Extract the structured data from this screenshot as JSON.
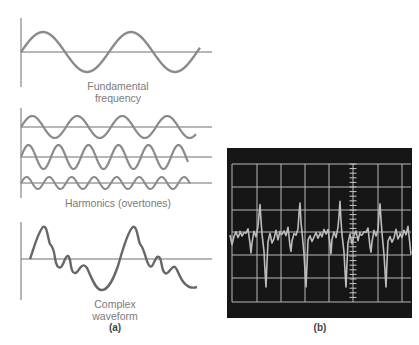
{
  "panel_a": {
    "fundamental": {
      "label_line1": "Fundamental",
      "label_line2": "frequency",
      "period_px": 88,
      "amplitude_px": 20
    },
    "harmonics": {
      "label": "Harmonics (overtones)",
      "waves": [
        {
          "name": "2nd harmonic",
          "period_px": 45,
          "amplitude_px": 11
        },
        {
          "name": "3rd harmonic",
          "period_px": 30,
          "amplitude_px": 12
        },
        {
          "name": "4th harmonic",
          "period_px": 22.5,
          "amplitude_px": 6
        }
      ]
    },
    "complex": {
      "label_line1": "Complex",
      "label_line2": "waveform"
    },
    "caption": "(a)"
  },
  "panel_b": {
    "caption": "(b)",
    "description": "Oscilloscope trace of complex waveform",
    "colors": {
      "screen": "#161616",
      "grid": "#b8b8b8",
      "trace": "#bdbdbd"
    },
    "grid_columns": 7,
    "grid_rows": 6
  },
  "colors": {
    "curve": "#8a8a8a",
    "axis": "#6f6f6f",
    "text": "#7a7a7a"
  }
}
